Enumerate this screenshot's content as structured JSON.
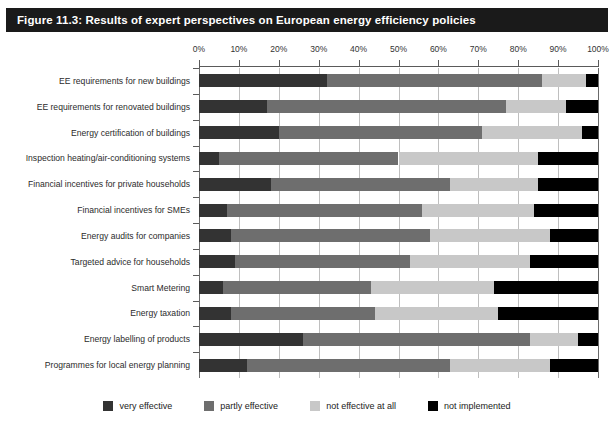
{
  "figure": {
    "title": "Figure 11.3: Results of expert perspectives on European energy efficiency policies",
    "title_bar_color": "#1a1a1a",
    "title_text_color": "#ffffff"
  },
  "chart_data": {
    "type": "bar",
    "orientation": "horizontal",
    "stacked": true,
    "normalized": "percent",
    "title": "Figure 11.3: Results of expert perspectives on European energy efficiency policies",
    "xlabel": "",
    "ylabel": "",
    "xlim": [
      0,
      100
    ],
    "grid": true,
    "grid_axis": "x",
    "legend_position": "bottom",
    "xticks": [
      0,
      10,
      20,
      30,
      40,
      50,
      60,
      70,
      80,
      90,
      100
    ],
    "xticklabels": [
      "0%",
      "10%",
      "20%",
      "30%",
      "40%",
      "50%",
      "60%",
      "70%",
      "80%",
      "90%",
      "100%"
    ],
    "categories": [
      "EE requirements for new buildings",
      "EE requirements for renovated buildings",
      "Energy certification of buildings",
      "Inspection heating/air-conditioning systems",
      "Financial incentives for private households",
      "Financial incentives for SMEs",
      "Energy audits for companies",
      "Targeted advice for households",
      "Smart Metering",
      "Energy taxation",
      "Energy labelling of products",
      "Programmes for local energy planning"
    ],
    "series": [
      {
        "name": "very effective",
        "color": "#333333",
        "values": [
          32,
          17,
          20,
          5,
          18,
          7,
          8,
          9,
          6,
          8,
          26,
          12
        ]
      },
      {
        "name": "partly effective",
        "color": "#6e6e6e",
        "values": [
          54,
          60,
          51,
          45,
          45,
          49,
          50,
          44,
          37,
          36,
          57,
          51
        ]
      },
      {
        "name": "not effective at all",
        "color": "#c8c8c8",
        "values": [
          11,
          15,
          25,
          35,
          22,
          28,
          30,
          30,
          31,
          31,
          12,
          25
        ]
      },
      {
        "name": "not implemented",
        "color": "#000000",
        "values": [
          3,
          8,
          4,
          15,
          15,
          16,
          12,
          17,
          26,
          25,
          5,
          12
        ]
      }
    ]
  },
  "legend": {
    "items": [
      {
        "label": "very effective",
        "color": "#333333"
      },
      {
        "label": "partly effective",
        "color": "#6e6e6e"
      },
      {
        "label": "not effective at all",
        "color": "#c8c8c8"
      },
      {
        "label": "not implemented",
        "color": "#000000"
      }
    ]
  }
}
